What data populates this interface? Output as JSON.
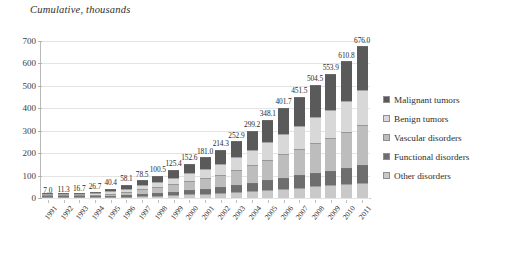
{
  "chart_data": {
    "type": "bar",
    "stacked": true,
    "title": "Cumulative, thousands",
    "xlabel": "",
    "ylabel": "",
    "ylim": [
      0,
      700
    ],
    "yticks": [
      0,
      100,
      200,
      300,
      400,
      500,
      600,
      700
    ],
    "grid": true,
    "legend_position": "right",
    "categories": [
      "1991",
      "1992",
      "1993",
      "1994",
      "1995",
      "1996",
      "1997",
      "1998",
      "1999",
      "2000",
      "2001",
      "2002",
      "2003",
      "2004",
      "2005",
      "2006",
      "2007",
      "2008",
      "2009",
      "2010",
      "2011"
    ],
    "totals": [
      7.0,
      11.3,
      16.7,
      26.7,
      40.4,
      58.1,
      78.5,
      100.5,
      125.4,
      152.6,
      181.0,
      214.3,
      252.9,
      299.2,
      348.1,
      401.7,
      451.5,
      504.5,
      553.9,
      610.8,
      676.0
    ],
    "total_labels": [
      "7.0",
      "11.3",
      "16.7",
      "26.7",
      "40.4",
      "58.1",
      "78.5",
      "100.5",
      "125.4",
      "152.6",
      "181.0",
      "214.3",
      "252.9",
      "299.2",
      "348.1",
      "401.7",
      "451.5",
      "504.5",
      "553.9",
      "610.8",
      "676.0"
    ],
    "series": [
      {
        "name": "Other disorders",
        "color": "#c9c9c9",
        "values": [
          0.8,
          1.3,
          1.9,
          3.0,
          4.5,
          6.4,
          8.6,
          11.0,
          13.7,
          16.6,
          19.6,
          23.1,
          27.1,
          31.7,
          36.6,
          41.8,
          46.6,
          51.5,
          56.2,
          61.5,
          67.6
        ]
      },
      {
        "name": "Functional disorders",
        "color": "#6e6e6e",
        "values": [
          0.9,
          1.4,
          2.0,
          3.2,
          4.9,
          7.0,
          9.4,
          12.1,
          15.0,
          18.3,
          21.7,
          25.7,
          30.3,
          35.9,
          41.8,
          48.2,
          54.2,
          60.5,
          66.5,
          73.3,
          81.1
        ]
      },
      {
        "name": "Vascular disorders",
        "color": "#bdbdbd",
        "values": [
          1.8,
          2.9,
          4.3,
          6.9,
          10.5,
          15.1,
          20.4,
          26.1,
          32.6,
          39.7,
          47.1,
          55.7,
          65.8,
          77.8,
          90.5,
          104.4,
          117.4,
          131.2,
          144.0,
          158.8,
          175.8
        ]
      },
      {
        "name": "Benign tumors",
        "color": "#d8d8d8",
        "values": [
          1.6,
          2.6,
          3.8,
          6.1,
          9.3,
          13.4,
          18.1,
          23.1,
          28.8,
          35.1,
          41.6,
          49.3,
          58.2,
          68.8,
          80.1,
          92.4,
          103.8,
          116.0,
          127.4,
          140.5,
          155.5
        ]
      },
      {
        "name": "Malignant tumors",
        "color": "#5a5a5a",
        "values": [
          1.9,
          3.1,
          4.7,
          7.5,
          11.2,
          16.2,
          22.0,
          28.2,
          35.3,
          42.9,
          51.0,
          60.5,
          71.5,
          85.0,
          99.1,
          114.9,
          129.5,
          145.3,
          159.8,
          176.7,
          196.0
        ]
      }
    ],
    "legend_order": [
      "Malignant tumors",
      "Benign tumors",
      "Vascular disorders",
      "Functional disorders",
      "Other disorders"
    ]
  }
}
